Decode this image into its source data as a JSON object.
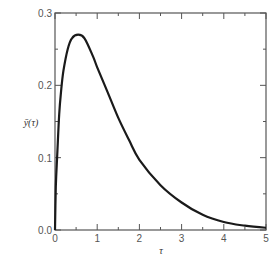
{
  "chart_data": {
    "type": "line",
    "title": "",
    "xlabel": "τ",
    "ylabel": "ȳ(τ)",
    "xlim": [
      0,
      5
    ],
    "ylim": [
      0,
      0.3
    ],
    "x_ticks": [
      "0",
      "1",
      "2",
      "3",
      "4",
      "5"
    ],
    "y_ticks": [
      "0.0",
      "0.1",
      "0.2",
      "0.3"
    ],
    "grid": false,
    "legend": null,
    "series": [
      {
        "name": "ȳ(τ)",
        "color": "#1a1a1a",
        "x": [
          0,
          0.02,
          0.05,
          0.1,
          0.15,
          0.2,
          0.3,
          0.4,
          0.55,
          0.7,
          0.9,
          1.0,
          1.25,
          1.5,
          1.75,
          2.0,
          2.5,
          3.0,
          3.5,
          4.0,
          4.5,
          5.0
        ],
        "y": [
          0,
          0.06,
          0.1,
          0.16,
          0.195,
          0.22,
          0.25,
          0.265,
          0.27,
          0.265,
          0.24,
          0.225,
          0.19,
          0.155,
          0.125,
          0.097,
          0.062,
          0.038,
          0.021,
          0.011,
          0.006,
          0.003
        ]
      }
    ]
  }
}
